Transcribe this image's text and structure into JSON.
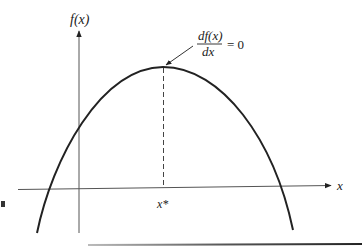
{
  "figure": {
    "type": "function-maximum-diagram",
    "y_axis": {
      "label": "f(x)"
    },
    "x_axis": {
      "label": "x"
    },
    "critical_point": {
      "label": "x*"
    },
    "annotation": {
      "numerator": "df(x)",
      "denominator": "dx",
      "rhs": "= 0"
    },
    "colors": {
      "ink": "#222222",
      "axis": "#555555",
      "background": "#ffffff"
    }
  }
}
